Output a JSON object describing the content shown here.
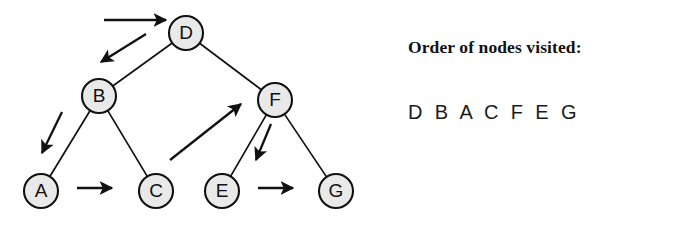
{
  "figure": {
    "type": "binary-tree-traversal-diagram"
  },
  "tree": {
    "nodes": [
      {
        "id": "D",
        "label": "D",
        "cx": 186,
        "cy": 33,
        "r": 17
      },
      {
        "id": "B",
        "label": "B",
        "cx": 99,
        "cy": 96,
        "r": 17
      },
      {
        "id": "F",
        "label": "F",
        "cx": 275,
        "cy": 100,
        "r": 17
      },
      {
        "id": "A",
        "label": "A",
        "cx": 41,
        "cy": 191,
        "r": 17
      },
      {
        "id": "C",
        "label": "C",
        "cx": 156,
        "cy": 191,
        "r": 17
      },
      {
        "id": "E",
        "label": "E",
        "cx": 222,
        "cy": 191,
        "r": 17
      },
      {
        "id": "G",
        "label": "G",
        "cx": 336,
        "cy": 191,
        "r": 17
      }
    ],
    "edges": [
      {
        "from": "D",
        "to": "B"
      },
      {
        "from": "D",
        "to": "F"
      },
      {
        "from": "B",
        "to": "A"
      },
      {
        "from": "B",
        "to": "C"
      },
      {
        "from": "F",
        "to": "E"
      },
      {
        "from": "F",
        "to": "G"
      }
    ]
  },
  "traversal": {
    "arrows": [
      {
        "name": "arrow-start-to-D",
        "x1": 104,
        "y1": 20,
        "x2": 166,
        "y2": 20
      },
      {
        "name": "arrow-D-to-B",
        "x1": 146,
        "y1": 34,
        "x2": 101,
        "y2": 62
      },
      {
        "name": "arrow-B-to-A",
        "x1": 62,
        "y1": 112,
        "x2": 42,
        "y2": 153
      },
      {
        "name": "arrow-A-to-C",
        "x1": 77,
        "y1": 188,
        "x2": 112,
        "y2": 188
      },
      {
        "name": "arrow-C-to-F",
        "x1": 170,
        "y1": 160,
        "x2": 241,
        "y2": 104
      },
      {
        "name": "arrow-F-to-E",
        "x1": 271,
        "y1": 124,
        "x2": 256,
        "y2": 160
      },
      {
        "name": "arrow-E-to-G",
        "x1": 258,
        "y1": 188,
        "x2": 293,
        "y2": 188
      }
    ]
  },
  "legend": {
    "title": "Order of nodes visited:",
    "sequence": "D B A C F E G",
    "order": [
      "D",
      "B",
      "A",
      "C",
      "F",
      "E",
      "G"
    ]
  },
  "colors": {
    "node_fill": "#e9e9e9",
    "stroke": "#111111",
    "background": "#ffffff",
    "text": "#111111"
  }
}
